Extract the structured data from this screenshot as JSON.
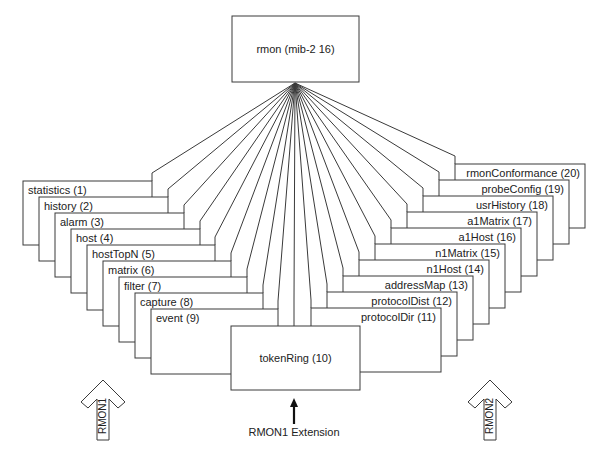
{
  "root": {
    "label": "rmon (mib-2 16)"
  },
  "rmon1_groups": [
    {
      "label": "statistics (1)"
    },
    {
      "label": "history (2)"
    },
    {
      "label": "alarm (3)"
    },
    {
      "label": "host (4)"
    },
    {
      "label": "hostTopN (5)"
    },
    {
      "label": "matrix (6)"
    },
    {
      "label": "filter (7)"
    },
    {
      "label": "capture (8)"
    },
    {
      "label": "event (9)"
    }
  ],
  "extension_group": {
    "label": "tokenRing (10)"
  },
  "rmon2_groups": [
    {
      "label": "protocolDir (11)"
    },
    {
      "label": "protocolDist (12)"
    },
    {
      "label": "addressMap (13)"
    },
    {
      "label": "n1Host (14)"
    },
    {
      "label": "n1Matrix (15)"
    },
    {
      "label": "a1Host (16)"
    },
    {
      "label": "a1Matrix (17)"
    },
    {
      "label": "usrHistory (18)"
    },
    {
      "label": "probeConfig (19)"
    },
    {
      "label": "rmonConformance (20)"
    }
  ],
  "annotations": {
    "rmon1_arrow": "RMON1",
    "rmon2_arrow": "RMON2",
    "extension_arrow": "RMON1 Extension"
  }
}
